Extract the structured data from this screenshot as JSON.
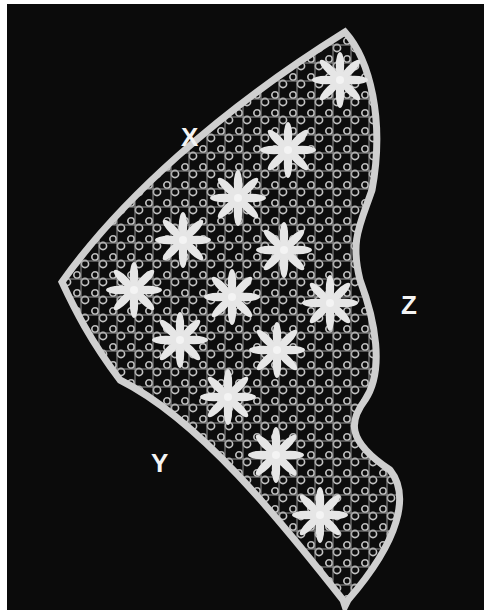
{
  "image": {
    "description": "Black-and-white photograph of a triangular lace piece with eight-pointed star motifs on a dark background",
    "background_color": "#0b0b0b",
    "lace_color": "#d8d8d8"
  },
  "labels": {
    "x": "X",
    "y": "Y",
    "z": "Z"
  },
  "motifs": {
    "type": "eight-pointed-star",
    "count": 14
  }
}
